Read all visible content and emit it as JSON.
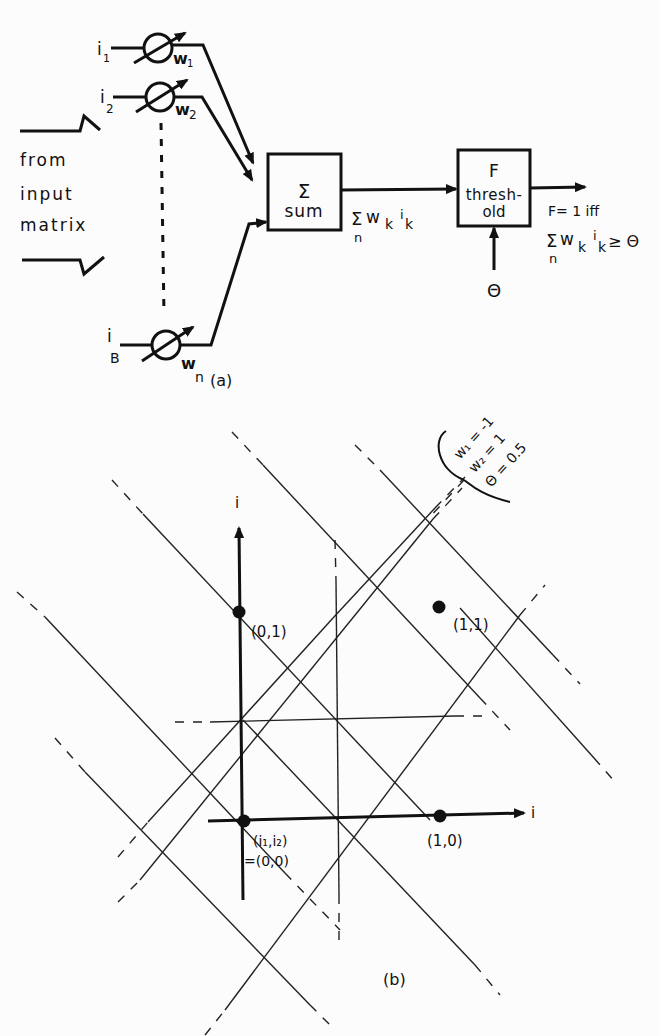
{
  "figure_a": {
    "caption": "(a)",
    "left_label": [
      "from",
      "input",
      "matrix"
    ],
    "inputs": [
      {
        "input": "i",
        "input_sub": "1",
        "weight": "w",
        "weight_sub": "1"
      },
      {
        "input": "i",
        "input_sub": "2",
        "weight": "w",
        "weight_sub": "2"
      },
      {
        "input": "i",
        "input_sub": "B",
        "weight": "w",
        "weight_sub": "n"
      }
    ],
    "sum_box": {
      "symbol": "Σ",
      "label": "sum"
    },
    "sum_output": {
      "sigma": "Σ",
      "term": "w",
      "k1": "k",
      "i": "i",
      "k2": "k",
      "under": "n"
    },
    "threshold_box": {
      "symbol": "F",
      "line1": "thresh-",
      "line2": "old"
    },
    "theta_input": "Θ",
    "output_rule": {
      "line1": "F= 1  iff",
      "sigma": "Σ",
      "term": "w",
      "k1": "k",
      "i": "i",
      "k2": "k",
      "relation": "≥ Θ",
      "under": "n"
    }
  },
  "figure_b": {
    "caption": "(b)",
    "parameters": [
      "w₁ = -1",
      "w₂ = 1",
      "Θ = 0.5"
    ],
    "vertical_axis_label": "i",
    "horizontal_axis_label": "i",
    "points": [
      {
        "label": "(0,1)"
      },
      {
        "label": "(1,1)"
      },
      {
        "label": "(1,0)"
      },
      {
        "label_line1": "(i₁,i₂)",
        "label_line2": "=(0,0)"
      }
    ]
  }
}
